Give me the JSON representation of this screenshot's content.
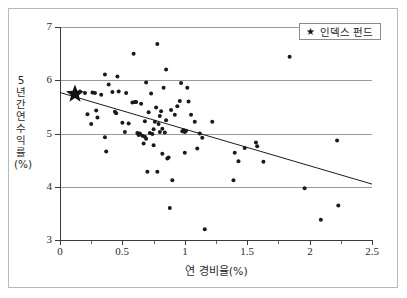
{
  "chart_data": {
    "type": "scatter",
    "title": "",
    "xlabel": "연 경비율(%)",
    "ylabel": "5년간 연 수익률(%)",
    "xlim": [
      0,
      2.5
    ],
    "ylim": [
      3,
      7
    ],
    "xticks": [
      "0",
      "0.5",
      "1",
      "1.5",
      "2",
      "2.5"
    ],
    "xtick_values": [
      0,
      0.5,
      1,
      1.5,
      2,
      2.5
    ],
    "xminor_values": [
      0.25,
      0.75,
      1.25,
      1.75,
      2.25
    ],
    "yticks": [
      "3",
      "4",
      "5",
      "6",
      "7"
    ],
    "ytick_values": [
      3,
      4,
      5,
      6,
      7
    ],
    "grid": "horizontal",
    "legend": {
      "position": "top-right",
      "entries": [
        {
          "marker": "star",
          "label": "인덱스 펀드"
        }
      ]
    },
    "trendline": {
      "x0": 0.0,
      "y0": 5.77,
      "x1": 2.5,
      "y1": 4.05,
      "color": "#1c1c1c"
    },
    "series": [
      {
        "name": "인덱스 펀드",
        "marker": "star",
        "color": "#111111",
        "points": [
          [
            0.12,
            5.74
          ]
        ]
      },
      {
        "name": "펀드",
        "marker": "circle",
        "color": "#1a1a1a",
        "points": [
          [
            0.16,
            5.79
          ],
          [
            0.2,
            5.76
          ],
          [
            0.22,
            5.36
          ],
          [
            0.25,
            5.18
          ],
          [
            0.26,
            5.77
          ],
          [
            0.28,
            5.76
          ],
          [
            0.29,
            5.43
          ],
          [
            0.3,
            5.3
          ],
          [
            0.33,
            5.73
          ],
          [
            0.36,
            6.11
          ],
          [
            0.36,
            4.93
          ],
          [
            0.37,
            4.66
          ],
          [
            0.39,
            5.92
          ],
          [
            0.42,
            5.78
          ],
          [
            0.44,
            5.41
          ],
          [
            0.45,
            5.38
          ],
          [
            0.46,
            6.07
          ],
          [
            0.47,
            5.79
          ],
          [
            0.5,
            5.2
          ],
          [
            0.52,
            5.03
          ],
          [
            0.53,
            5.76
          ],
          [
            0.55,
            5.19
          ],
          [
            0.58,
            5.58
          ],
          [
            0.59,
            6.5
          ],
          [
            0.6,
            5.59
          ],
          [
            0.61,
            5.59
          ],
          [
            0.62,
            5.01
          ],
          [
            0.63,
            4.97
          ],
          [
            0.64,
            5.0
          ],
          [
            0.65,
            5.56
          ],
          [
            0.66,
            4.96
          ],
          [
            0.67,
            4.81
          ],
          [
            0.68,
            4.94
          ],
          [
            0.68,
            5.23
          ],
          [
            0.69,
            5.96
          ],
          [
            0.69,
            4.9
          ],
          [
            0.7,
            4.28
          ],
          [
            0.71,
            5.4
          ],
          [
            0.72,
            5.01
          ],
          [
            0.73,
            5.75
          ],
          [
            0.74,
            4.99
          ],
          [
            0.75,
            5.08
          ],
          [
            0.75,
            4.78
          ],
          [
            0.76,
            5.22
          ],
          [
            0.77,
            5.49
          ],
          [
            0.78,
            6.68
          ],
          [
            0.78,
            4.28
          ],
          [
            0.79,
            5.18
          ],
          [
            0.8,
            5.33
          ],
          [
            0.8,
            5.03
          ],
          [
            0.81,
            5.42
          ],
          [
            0.82,
            5.09
          ],
          [
            0.82,
            4.62
          ],
          [
            0.83,
            5.86
          ],
          [
            0.84,
            5.02
          ],
          [
            0.85,
            6.2
          ],
          [
            0.85,
            5.25
          ],
          [
            0.86,
            4.53
          ],
          [
            0.87,
            4.55
          ],
          [
            0.88,
            3.6
          ],
          [
            0.89,
            5.44
          ],
          [
            0.9,
            4.12
          ],
          [
            0.92,
            5.35
          ],
          [
            0.94,
            5.51
          ],
          [
            0.96,
            5.61
          ],
          [
            0.97,
            5.95
          ],
          [
            0.98,
            5.04
          ],
          [
            0.99,
            5.06
          ],
          [
            1.0,
            5.03
          ],
          [
            1.0,
            4.64
          ],
          [
            1.01,
            5.05
          ],
          [
            1.02,
            5.86
          ],
          [
            1.03,
            5.6
          ],
          [
            1.05,
            5.35
          ],
          [
            1.08,
            5.22
          ],
          [
            1.1,
            4.72
          ],
          [
            1.12,
            5.0
          ],
          [
            1.14,
            4.92
          ],
          [
            1.16,
            3.2
          ],
          [
            1.22,
            5.22
          ],
          [
            1.39,
            4.12
          ],
          [
            1.4,
            4.64
          ],
          [
            1.43,
            4.48
          ],
          [
            1.48,
            4.73
          ],
          [
            1.57,
            4.83
          ],
          [
            1.58,
            4.76
          ],
          [
            1.63,
            4.47
          ],
          [
            1.84,
            6.44
          ],
          [
            1.96,
            3.97
          ],
          [
            2.09,
            3.38
          ],
          [
            2.22,
            4.87
          ],
          [
            2.23,
            3.65
          ]
        ]
      }
    ]
  }
}
